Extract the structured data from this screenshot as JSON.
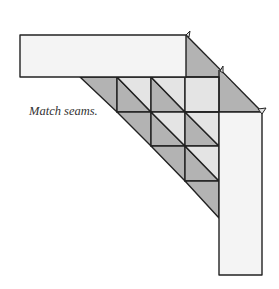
{
  "caption": "Match seams.",
  "colors": {
    "background": "#ffffff",
    "strip_fill": "#f4f4f4",
    "dark_fabric": "#b3b3b3",
    "light_fabric": "#e4e4e4",
    "stroke": "#222222"
  },
  "diagram": {
    "horizontal_strip": {
      "x": 20,
      "y": 35,
      "w": 166,
      "h": 42
    },
    "vertical_strip": {
      "x": 219,
      "y": 112,
      "w": 43,
      "h": 163
    },
    "grid": {
      "cols_x": [
        117,
        151,
        185,
        219
      ],
      "rows_y": [
        77,
        112,
        146,
        181,
        215
      ]
    }
  }
}
